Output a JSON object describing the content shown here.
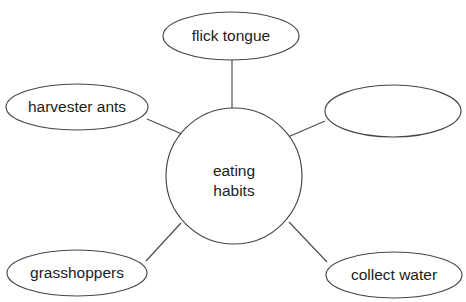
{
  "diagram": {
    "type": "bubble-map",
    "canvas": {
      "width": 466,
      "height": 302,
      "background": "#ffffff"
    },
    "style": {
      "stroke_color": "#454545",
      "fill_color": "#ffffff",
      "text_color": "#1c1c1c",
      "connector_color": "#4a4a4a"
    },
    "center": {
      "label_line1": "eating",
      "label_line2": "habits",
      "cx": 234,
      "cy": 176,
      "r": 68
    },
    "nodes": [
      {
        "id": "flick-tongue",
        "label": "flick tongue",
        "cx": 231,
        "cy": 36,
        "rx": 68,
        "ry": 24,
        "empty": false
      },
      {
        "id": "harvester-ants",
        "label": "harvester ants",
        "cx": 77,
        "cy": 107,
        "rx": 71,
        "ry": 23,
        "empty": false
      },
      {
        "id": "blank-right",
        "label": "",
        "cx": 393,
        "cy": 111,
        "rx": 68,
        "ry": 26,
        "empty": true
      },
      {
        "id": "grasshoppers",
        "label": "grasshoppers",
        "cx": 77,
        "cy": 273,
        "rx": 70,
        "ry": 23,
        "empty": false
      },
      {
        "id": "collect-water",
        "label": "collect water",
        "cx": 394,
        "cy": 275,
        "rx": 68,
        "ry": 23,
        "empty": false
      }
    ],
    "connectors": [
      {
        "id": "conn-flick-tongue",
        "x1": 232,
        "y1": 60,
        "x2": 232,
        "y2": 108
      },
      {
        "id": "conn-harvester-ants",
        "x1": 147,
        "y1": 119,
        "x2": 182,
        "y2": 134
      },
      {
        "id": "conn-blank-right",
        "x1": 325,
        "y1": 121,
        "x2": 288,
        "y2": 137
      },
      {
        "id": "conn-grasshoppers",
        "x1": 146,
        "y1": 261,
        "x2": 181,
        "y2": 223
      },
      {
        "id": "conn-collect-water",
        "x1": 327,
        "y1": 262,
        "x2": 289,
        "y2": 222
      }
    ]
  }
}
